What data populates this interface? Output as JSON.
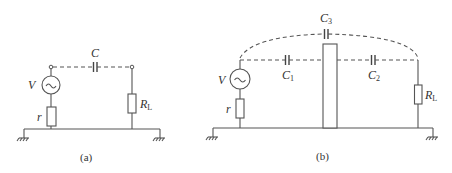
{
  "figure": {
    "panel_a": {
      "caption": "(a)",
      "labels": {
        "source": "V",
        "source_symbol": "~",
        "internal_resistance": "r",
        "capacitor": "C",
        "load_main": "R",
        "load_sub": "L"
      }
    },
    "panel_b": {
      "caption": "(b)",
      "labels": {
        "source": "V",
        "source_symbol": "~",
        "internal_resistance": "r",
        "c1_main": "C",
        "c1_sub": "1",
        "c2_main": "C",
        "c2_sub": "2",
        "c3_main": "C",
        "c3_sub": "3",
        "load_main": "R",
        "load_sub": "L"
      }
    }
  }
}
